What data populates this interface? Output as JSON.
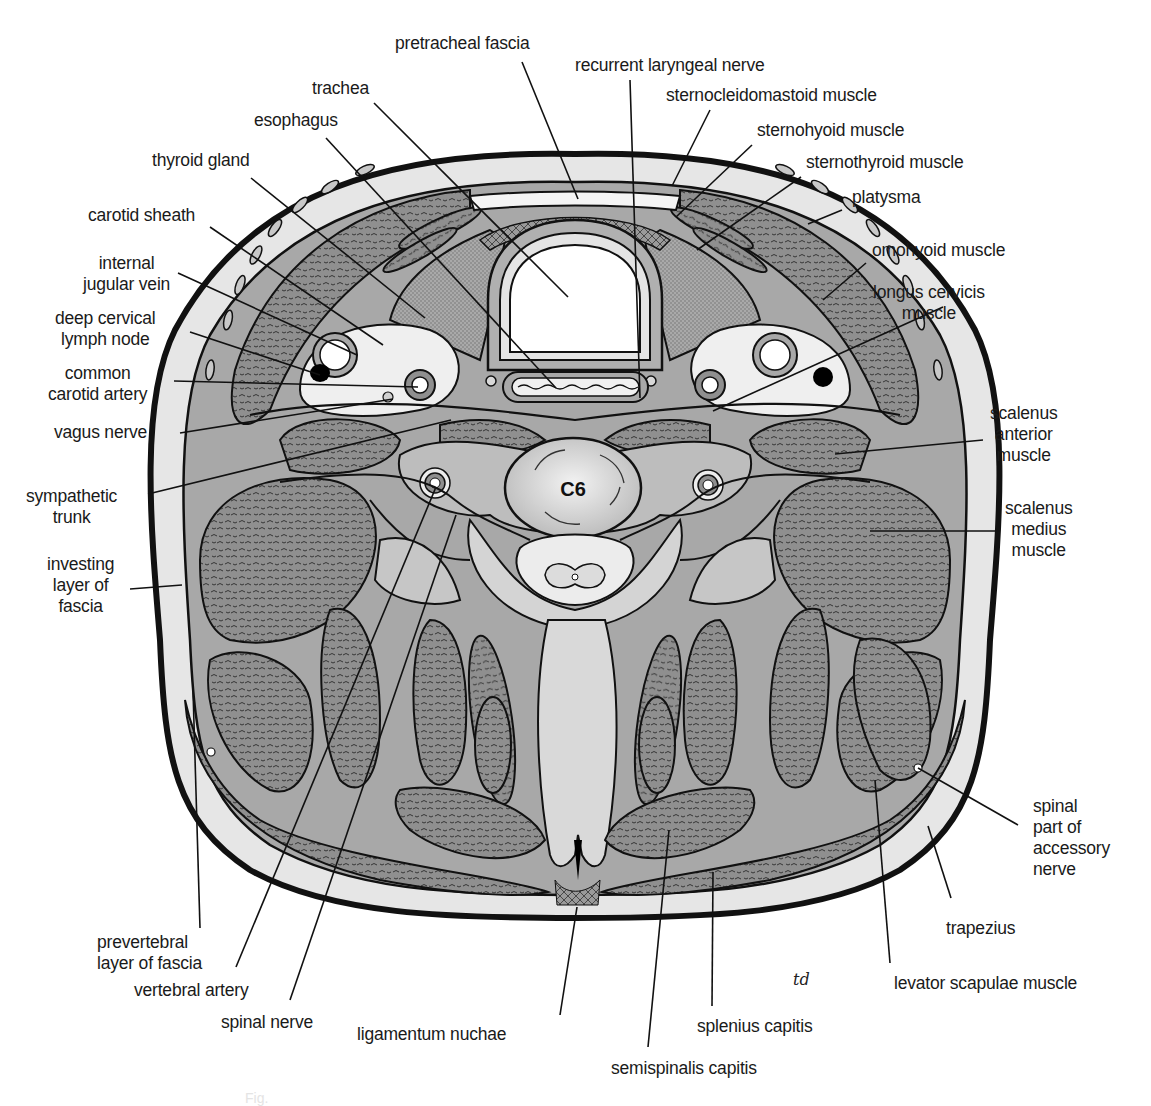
{
  "figure": {
    "type": "anatomical cross-section",
    "vertebra_label": "C6",
    "artist_signature": "td",
    "colors": {
      "outline": "#111111",
      "skin_band": "#e6e6e6",
      "muscle": "#8f8f8f",
      "fascia": "#a8a8a8",
      "light_tissue": "#d4d4d4",
      "background": "#ffffff",
      "lymph_node": "#000000"
    }
  },
  "labels": [
    {
      "id": "pretracheal-fascia",
      "text": "pretracheal fascia",
      "x": 395,
      "y": 33,
      "align": "l",
      "lines": [
        [
          522,
          62,
          578,
          199
        ]
      ]
    },
    {
      "id": "recurrent-laryngeal-nerve",
      "text": "recurrent laryngeal nerve",
      "x": 575,
      "y": 55,
      "align": "l",
      "lines": [
        [
          630,
          80,
          640,
          398
        ]
      ]
    },
    {
      "id": "trachea",
      "text": "trachea",
      "x": 312,
      "y": 78,
      "align": "l",
      "lines": [
        [
          374,
          103,
          568,
          297
        ]
      ]
    },
    {
      "id": "sternocleidomastoid-muscle",
      "text": "sternocleidomastoid muscle",
      "x": 666,
      "y": 85,
      "align": "l",
      "lines": [
        [
          710,
          110,
          672,
          186
        ]
      ]
    },
    {
      "id": "esophagus",
      "text": "esophagus",
      "x": 254,
      "y": 110,
      "align": "l",
      "lines": [
        [
          326,
          138,
          556,
          388
        ]
      ]
    },
    {
      "id": "sternohyoid-muscle",
      "text": "sternohyoid muscle",
      "x": 757,
      "y": 120,
      "align": "l",
      "lines": [
        [
          752,
          145,
          676,
          217
        ]
      ]
    },
    {
      "id": "thyroid-gland",
      "text": "thyroid gland",
      "x": 152,
      "y": 150,
      "align": "l",
      "lines": [
        [
          251,
          178,
          425,
          318
        ]
      ]
    },
    {
      "id": "sternothyroid-muscle",
      "text": "sternothyroid muscle",
      "x": 806,
      "y": 152,
      "align": "l",
      "lines": [
        [
          801,
          177,
          697,
          250
        ]
      ]
    },
    {
      "id": "platysma",
      "text": "platysma",
      "x": 852,
      "y": 187,
      "align": "l",
      "lines": [
        [
          842,
          210,
          808,
          224
        ]
      ]
    },
    {
      "id": "carotid-sheath",
      "text": "carotid sheath",
      "x": 88,
      "y": 205,
      "align": "l",
      "lines": [
        [
          210,
          227,
          383,
          345
        ]
      ]
    },
    {
      "id": "omohyoid-muscle",
      "text": "omohyoid muscle",
      "x": 872,
      "y": 240,
      "align": "l",
      "lines": [
        [
          866,
          263,
          823,
          300
        ]
      ]
    },
    {
      "id": "internal-jugular-vein",
      "text": "internal\njugular vein",
      "x": 83,
      "y": 253,
      "align": "c",
      "lines": [
        [
          178,
          273,
          357,
          355
        ]
      ]
    },
    {
      "id": "longus-cervicis-muscle",
      "text": "longus cervicis\nmuscle",
      "x": 873,
      "y": 282,
      "align": "c",
      "lines": [
        [
          943,
          307,
          713,
          411
        ]
      ]
    },
    {
      "id": "deep-cervical-lymph-node",
      "text": "deep cervical\nlymph node",
      "x": 55,
      "y": 308,
      "align": "c",
      "lines": [
        [
          190,
          332,
          320,
          375
        ]
      ]
    },
    {
      "id": "common-carotid-artery",
      "text": "common\ncarotid artery",
      "x": 48,
      "y": 363,
      "align": "c",
      "lines": [
        [
          174,
          381,
          418,
          387
        ]
      ]
    },
    {
      "id": "vagus-nerve",
      "text": "vagus nerve",
      "x": 54,
      "y": 422,
      "align": "l",
      "lines": [
        [
          180,
          433,
          393,
          399
        ]
      ]
    },
    {
      "id": "scalenus-anterior-muscle",
      "text": "scalenus\nanterior\nmuscle",
      "x": 990,
      "y": 403,
      "align": "c",
      "lines": [
        [
          983,
          440,
          835,
          454
        ]
      ]
    },
    {
      "id": "sympathetic-trunk",
      "text": "sympathetic\ntrunk",
      "x": 26,
      "y": 486,
      "align": "c",
      "lines": [
        [
          148,
          494,
          451,
          420
        ]
      ]
    },
    {
      "id": "scalenus-medius-muscle",
      "text": "scalenus\nmedius\nmuscle",
      "x": 1005,
      "y": 498,
      "align": "c",
      "lines": [
        [
          1000,
          531,
          870,
          531
        ]
      ]
    },
    {
      "id": "investing-layer-of-fascia",
      "text": "investing\nlayer of\nfascia",
      "x": 47,
      "y": 554,
      "align": "c",
      "lines": [
        [
          130,
          589,
          182,
          585
        ]
      ]
    },
    {
      "id": "spinal-part-of-accessory-nerve",
      "text": "spinal\npart of\naccessory\nnerve",
      "x": 1033,
      "y": 796,
      "align": "l",
      "lines": [
        [
          1018,
          825,
          918,
          768
        ]
      ]
    },
    {
      "id": "trapezius",
      "text": "trapezius",
      "x": 946,
      "y": 918,
      "align": "l",
      "lines": [
        [
          951,
          898,
          928,
          826
        ]
      ]
    },
    {
      "id": "prevertebral-layer-of-fascia",
      "text": "prevertebral\nlayer of fascia",
      "x": 97,
      "y": 932,
      "align": "l",
      "lines": [
        [
          200,
          928,
          193,
          690
        ]
      ]
    },
    {
      "id": "vertebral-artery",
      "text": "vertebral artery",
      "x": 134,
      "y": 980,
      "align": "l",
      "lines": [
        [
          236,
          967,
          436,
          487
        ]
      ]
    },
    {
      "id": "levator-scapulae-muscle",
      "text": "levator scapulae muscle",
      "x": 894,
      "y": 973,
      "align": "l",
      "lines": [
        [
          890,
          963,
          875,
          780
        ]
      ]
    },
    {
      "id": "spinal-nerve",
      "text": "spinal nerve",
      "x": 221,
      "y": 1012,
      "align": "l",
      "lines": [
        [
          290,
          1000,
          456,
          515
        ]
      ]
    },
    {
      "id": "splenius-capitis",
      "text": "splenius capitis",
      "x": 697,
      "y": 1016,
      "align": "l",
      "lines": [
        [
          712,
          1006,
          713,
          872
        ]
      ]
    },
    {
      "id": "ligamentum-nuchae",
      "text": "ligamentum nuchae",
      "x": 357,
      "y": 1024,
      "align": "l",
      "lines": [
        [
          560,
          1015,
          577,
          907
        ]
      ]
    },
    {
      "id": "semispinalis-capitis",
      "text": "semispinalis capitis",
      "x": 611,
      "y": 1058,
      "align": "l",
      "lines": [
        [
          648,
          1047,
          669,
          830
        ]
      ]
    }
  ],
  "footer_faded_text": "Fig."
}
